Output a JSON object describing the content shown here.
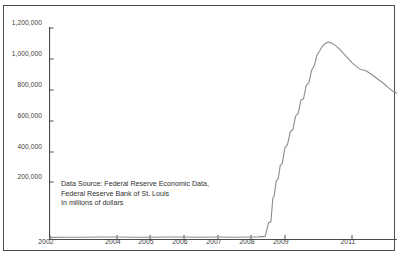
{
  "figure": {
    "title_fragment": "",
    "annotation_lines": [
      "Data Source: Federal Reserve Economic Data,",
      "Federal Reserve Bank of St. Louis",
      "In millions of dollars"
    ],
    "line_color": "#8c8c8c",
    "axis_color": "#4d4d4d",
    "frame_color": "#4d4d4d",
    "background": "#ffffff"
  },
  "chart_data": {
    "type": "line",
    "title": "",
    "subtitle": "",
    "xlabel": "",
    "ylabel": "",
    "units_note": "In millions of dollars",
    "source": "Federal Reserve Economic Data, Federal Reserve Bank of St. Louis",
    "grid": false,
    "legend": false,
    "legend_position": "none",
    "xlim": [
      2002.0,
      2012.4
    ],
    "ylim": [
      0,
      1200000
    ],
    "y_tick_labels": [
      "1,200,000",
      "1,000,000",
      "800,000",
      "600,000",
      "400,000",
      "200,000"
    ],
    "y_ticks": [
      1200000,
      1000000,
      800000,
      600000,
      400000,
      200000
    ],
    "x_tick_labels": [
      "2002",
      "2004",
      "2005",
      "2006",
      "2007",
      "2008",
      "2009",
      "2011"
    ],
    "x_ticks": [
      2002,
      2004,
      2005,
      2006,
      2007,
      2008,
      2009,
      2011
    ],
    "series": [
      {
        "name": "Reserve balances",
        "color": "#8c8c8c",
        "x": [
          2002.0,
          2002.5,
          2003.0,
          2003.5,
          2004.0,
          2004.5,
          2005.0,
          2005.5,
          2006.0,
          2006.5,
          2007.0,
          2007.5,
          2008.0,
          2008.25,
          2008.45,
          2008.55,
          2008.62,
          2008.68,
          2008.72,
          2008.78,
          2008.84,
          2008.9,
          2008.96,
          2009.04,
          2009.12,
          2009.2,
          2009.28,
          2009.36,
          2009.44,
          2009.52,
          2009.6,
          2009.68,
          2009.76,
          2009.84,
          2009.92,
          2010.0,
          2010.08,
          2010.16,
          2010.24,
          2010.34,
          2010.44,
          2010.56,
          2010.68,
          2010.8,
          2010.92,
          2011.04,
          2011.16,
          2011.3,
          2011.44,
          2011.58,
          2011.72,
          2011.86,
          2012.0,
          2012.14,
          2012.28,
          2012.4
        ],
        "y": [
          12000,
          13000,
          13000,
          14000,
          14000,
          13000,
          13000,
          14000,
          14000,
          13000,
          14000,
          13000,
          14000,
          15000,
          18000,
          95000,
          100000,
          235000,
          250000,
          330000,
          345000,
          420000,
          430000,
          520000,
          540000,
          610000,
          625000,
          700000,
          715000,
          790000,
          800000,
          875000,
          890000,
          960000,
          985000,
          1045000,
          1070000,
          1095000,
          1110000,
          1120000,
          1115000,
          1100000,
          1080000,
          1055000,
          1030000,
          1005000,
          985000,
          965000,
          960000,
          945000,
          925000,
          905000,
          885000,
          862000,
          840000,
          830000
        ]
      }
    ],
    "annotations": [
      {
        "text": "Data Source: Federal Reserve Economic Data, Federal Reserve Bank of St. Louis In millions of dollars",
        "x": 2002.4,
        "y": 215000
      }
    ],
    "peak": {
      "value": 1120000,
      "approx_date": "2010.34"
    },
    "end_value": 830000,
    "start_value": 12000
  }
}
